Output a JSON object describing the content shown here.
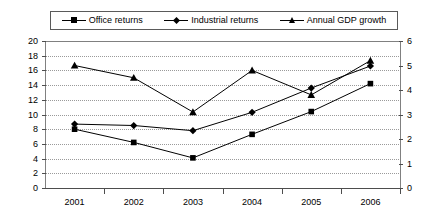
{
  "legend": {
    "position": "top",
    "entries": [
      {
        "label": "Office returns",
        "marker": "square-marker"
      },
      {
        "label": "Industrial returns",
        "marker": "diamond-marker"
      },
      {
        "label": "Annual GDP growth",
        "marker": "triangle-marker"
      }
    ]
  },
  "chart_data": {
    "type": "line",
    "title": "",
    "xlabel": "",
    "ylabel": "",
    "grid": true,
    "legend_position": "top",
    "categories": [
      "2001",
      "2002",
      "2003",
      "2004",
      "2005",
      "2006"
    ],
    "axes": {
      "left": {
        "min": 0,
        "max": 20,
        "step": 2,
        "ticks": [
          "0",
          "2",
          "4",
          "6",
          "8",
          "10",
          "12",
          "14",
          "16",
          "18",
          "20"
        ]
      },
      "right": {
        "min": 0,
        "max": 6,
        "step": 1,
        "ticks": [
          "0",
          "1",
          "2",
          "3",
          "4",
          "5",
          "6"
        ]
      }
    },
    "series": [
      {
        "name": "Office returns",
        "axis": "left",
        "marker": "square",
        "color": "#000000",
        "values": [
          8.0,
          6.2,
          4.1,
          7.3,
          10.4,
          14.2
        ]
      },
      {
        "name": "Industrial returns",
        "axis": "left",
        "marker": "diamond",
        "color": "#000000",
        "values": [
          8.7,
          8.5,
          7.8,
          10.3,
          13.6,
          16.6
        ]
      },
      {
        "name": "Annual GDP growth",
        "axis": "right",
        "marker": "triangle",
        "color": "#000000",
        "values": [
          5.0,
          4.5,
          3.1,
          4.8,
          3.8,
          5.2
        ]
      }
    ]
  }
}
